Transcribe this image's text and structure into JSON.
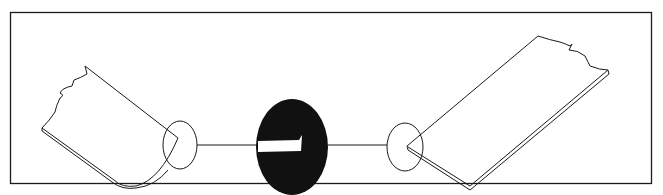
{
  "diagram": {
    "colors": {
      "background": "#ffffff",
      "stroke": "#1a1a1a",
      "fill_dark": "#111111",
      "bar": "#ffffff"
    },
    "elements": [
      {
        "name": "left-panel",
        "shape": "bent sheet with torn edge"
      },
      {
        "name": "left-detail-circle",
        "shape": "circle"
      },
      {
        "name": "center-oval",
        "shape": "black oval with white bar"
      },
      {
        "name": "right-detail-circle",
        "shape": "circle"
      },
      {
        "name": "right-panel",
        "shape": "flat sheet with torn edge"
      }
    ]
  }
}
